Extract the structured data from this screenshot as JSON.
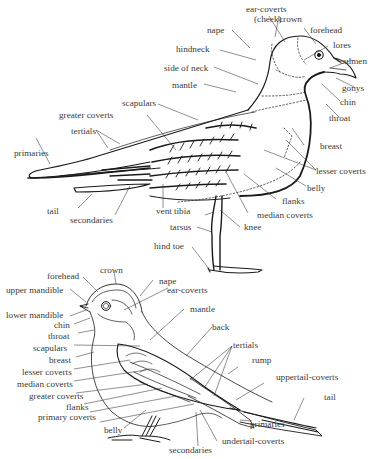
{
  "diagram": {
    "gull": {
      "name": "gull (upper figure)",
      "labels": {
        "ear_coverts": "ear-coverts",
        "cheek": "(cheek)",
        "crown": "crown",
        "nape": "nape",
        "forehead": "forehead",
        "lores": "lores",
        "culmen": "culmen",
        "hindneck": "hindneck",
        "side_of_neck": "side of neck",
        "mantle": "mantle",
        "gonys": "gonys",
        "chin": "chin",
        "throat": "throat",
        "scapulars": "scapulars",
        "greater_coverts": "greater coverts",
        "tertials": "tertials",
        "primaries": "primaries",
        "breast": "breast",
        "lesser_coverts": "lesser coverts",
        "belly": "belly",
        "flanks": "flanks",
        "median_coverts": "median coverts",
        "tail": "tail",
        "secondaries": "secondaries",
        "vent": "vent",
        "tibia": "tibia",
        "knee": "knee",
        "tarsus": "tarsus",
        "hind_toe": "hind toe"
      }
    },
    "sparrow": {
      "name": "sparrow (lower figure)",
      "labels": {
        "crown": "crown",
        "forehead": "forehead",
        "nape": "nape",
        "upper_mandible": "upper mandible",
        "ear_coverts": "ear-coverts",
        "lower_mandible": "lower mandible",
        "chin": "chin",
        "throat": "throat",
        "mantle": "mantle",
        "back": "back",
        "scapulars": "scapulars",
        "tertials": "tertials",
        "breast": "breast",
        "rump": "rump",
        "lesser_coverts": "lesser coverts",
        "uppertail_coverts": "uppertail-coverts",
        "median_coverts": "median coverts",
        "greater_coverts": "greater coverts",
        "tail": "tail",
        "flanks": "flanks",
        "primaries": "primaries",
        "primary_coverts": "primary coverts",
        "belly": "belly",
        "undertail_coverts": "undertail-coverts",
        "secondaries": "secondaries"
      }
    },
    "colors": {
      "ink": "#1a1a1a",
      "label": "#3a3a3a",
      "background": "#ffffff"
    }
  }
}
